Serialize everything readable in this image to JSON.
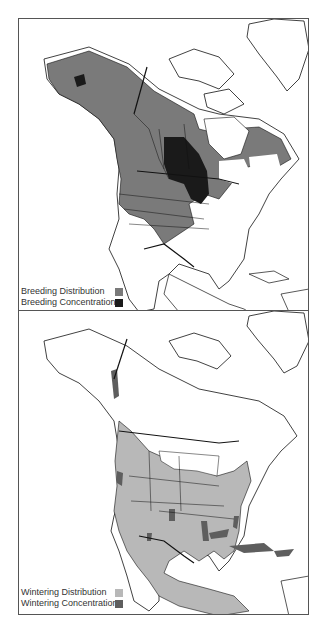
{
  "maps": [
    {
      "id": "breeding",
      "legend": [
        {
          "label": "Breeding Distribution",
          "color": "#7a7a7a"
        },
        {
          "label": "Breeding Concentration",
          "color": "#1a1a1a"
        }
      ]
    },
    {
      "id": "wintering",
      "legend": [
        {
          "label": "Wintering Distribution",
          "color": "#b8b8b8"
        },
        {
          "label": "Wintering Concentration",
          "color": "#5e5e5e"
        }
      ]
    }
  ]
}
